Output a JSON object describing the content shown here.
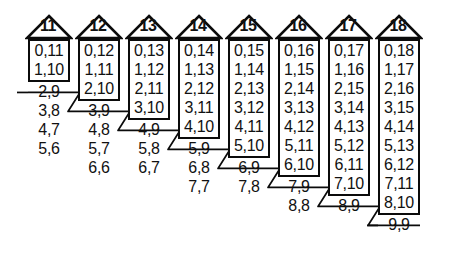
{
  "figure": {
    "type": "partition-diagram",
    "column_count": 8,
    "pair_separator": ","
  },
  "geometry": {
    "column_x": [
      24,
      74,
      124,
      174,
      224,
      274,
      324,
      374
    ],
    "column_width": 50,
    "row_height": 19,
    "box_top": 39,
    "roof_height": 26,
    "stroke_color": "#0b0b0b",
    "text_color": "#111111",
    "background": "#ffffff"
  },
  "columns": [
    {
      "label": "11",
      "boxed": [
        "0,11",
        "1,10"
      ],
      "tail": [
        "2,9",
        "3,8",
        "4,7",
        "5,6"
      ],
      "struck_index": 0
    },
    {
      "label": "12",
      "boxed": [
        "0,12",
        "1,11",
        "2,10"
      ],
      "tail": [
        "3,9",
        "4,8",
        "5,7",
        "6,6"
      ],
      "struck_index": 0
    },
    {
      "label": "13",
      "boxed": [
        "0,13",
        "1,12",
        "2,11",
        "3,10"
      ],
      "tail": [
        "4,9",
        "5,8",
        "6,7"
      ],
      "struck_index": 0
    },
    {
      "label": "14",
      "boxed": [
        "0,14",
        "1,13",
        "2,12",
        "3,11",
        "4,10"
      ],
      "tail": [
        "5,9",
        "6,8",
        "7,7"
      ],
      "struck_index": 0
    },
    {
      "label": "15",
      "boxed": [
        "0,15",
        "1,14",
        "2,13",
        "3,12",
        "4,11",
        "5,10"
      ],
      "tail": [
        "6,9",
        "7,8"
      ],
      "struck_index": 0
    },
    {
      "label": "16",
      "boxed": [
        "0,16",
        "1,15",
        "2,14",
        "3,13",
        "4,12",
        "5,11",
        "6,10"
      ],
      "tail": [
        "7,9",
        "8,8"
      ],
      "struck_index": 0
    },
    {
      "label": "17",
      "boxed": [
        "0,17",
        "1,16",
        "2,15",
        "3,14",
        "4,13",
        "5,12",
        "6,11",
        "7,10"
      ],
      "tail": [
        "8,9"
      ],
      "struck_index": 0
    },
    {
      "label": "18",
      "boxed": [
        "0,18",
        "1,17",
        "2,16",
        "3,15",
        "4,14",
        "5,13",
        "6,12",
        "7,11",
        "8,10"
      ],
      "tail": [
        "9,9"
      ],
      "struck_index": 0
    }
  ],
  "connectors": [
    {
      "from_column": "11",
      "to_column": "12"
    },
    {
      "from_column": "12",
      "to_column": "13"
    },
    {
      "from_column": "13",
      "to_column": "14"
    },
    {
      "from_column": "14",
      "to_column": "15"
    },
    {
      "from_column": "15",
      "to_column": "16"
    },
    {
      "from_column": "16",
      "to_column": "17"
    },
    {
      "from_column": "17",
      "to_column": "18"
    },
    {
      "from_column": "18",
      "to_column": "end"
    }
  ]
}
